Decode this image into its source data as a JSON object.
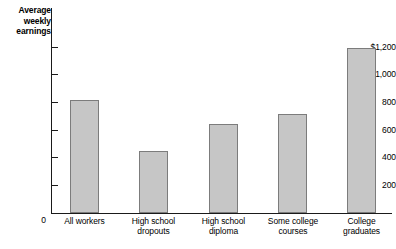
{
  "chart_data": {
    "type": "bar",
    "title": "Average weekly earnings",
    "xlabel": "",
    "ylabel": "Average weekly earnings",
    "categories": [
      "All workers",
      "High school dropouts",
      "High school diploma",
      "Some college courses",
      "College graduates"
    ],
    "values": [
      820,
      450,
      645,
      720,
      1190
    ],
    "ylim": [
      0,
      1300
    ],
    "ytick_labels": [
      "$1,200",
      "1,000",
      "800",
      "600",
      "400",
      "200",
      "0"
    ],
    "ytick_values": [
      1200,
      1000,
      800,
      600,
      400,
      200,
      0
    ],
    "grid": false,
    "legend": null,
    "bar_color": "#c6c6c6",
    "bar_border_color": "#7c7c7c",
    "axis_color": "#1a1a1a"
  },
  "axis_title": {
    "line1": "Average",
    "line2": "weekly",
    "line3": "earnings"
  },
  "y_axis": {
    "ticks": [
      {
        "label": "$1,200",
        "value": 1200
      },
      {
        "label": "1,000",
        "value": 1000
      },
      {
        "label": "800",
        "value": 800
      },
      {
        "label": "600",
        "value": 600
      },
      {
        "label": "400",
        "value": 400
      },
      {
        "label": "200",
        "value": 200
      }
    ],
    "zero_label": "0"
  },
  "bars": [
    {
      "label_line1": "All workers",
      "label_line2": "",
      "value": 820
    },
    {
      "label_line1": "High school",
      "label_line2": "dropouts",
      "value": 450
    },
    {
      "label_line1": "High school",
      "label_line2": "diploma",
      "value": 645
    },
    {
      "label_line1": "Some college",
      "label_line2": "courses",
      "value": 720
    },
    {
      "label_line1": "College",
      "label_line2": "graduates",
      "value": 1190
    }
  ]
}
